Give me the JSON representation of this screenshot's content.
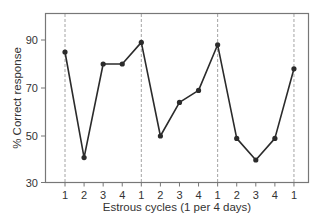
{
  "chart_data": {
    "type": "line",
    "title": "",
    "xlabel": "Estrous cycles (1 per 4 days)",
    "ylabel": "% Correct response",
    "categories": [
      "1",
      "2",
      "3",
      "4",
      "1",
      "2",
      "3",
      "4",
      "1",
      "2",
      "3",
      "4",
      "1"
    ],
    "series": [
      {
        "name": "% Correct response",
        "values": [
          85,
          41,
          80,
          80,
          89,
          50,
          64,
          69,
          88,
          49,
          40,
          49,
          78
        ]
      }
    ],
    "ylim": [
      30,
      100
    ],
    "yticks": [
      30,
      50,
      70,
      90
    ],
    "cycle_boundaries_at_indices": [
      0,
      4,
      8,
      12
    ],
    "grid": false,
    "legend": "none",
    "colors": {
      "line": "#2b2b2b",
      "frame": "#777777",
      "dashed": "#9a9a9a"
    }
  }
}
